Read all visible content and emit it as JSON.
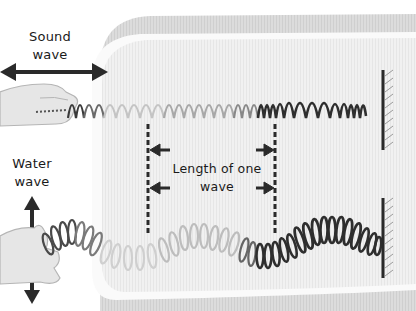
{
  "diagram": {
    "labels": {
      "sound_line1": "Sound",
      "sound_line2": "wave",
      "water_line1": "Water",
      "water_line2": "wave",
      "wavelength": "Length of one wave"
    },
    "nodes": [
      {
        "id": "hand-top",
        "label": "Hand pushing spring (sound wave)"
      },
      {
        "id": "spring-top",
        "label": "Compression spring (longitudinal)"
      },
      {
        "id": "wall-top",
        "label": "Fixed wall"
      },
      {
        "id": "hand-bottom",
        "label": "Hand shaking spring (water wave)"
      },
      {
        "id": "spring-bottom",
        "label": "Spring wave (transverse)"
      },
      {
        "id": "wall-bottom",
        "label": "Fixed wall"
      }
    ],
    "arrows": [
      {
        "id": "sound-motion",
        "direction": "left-right"
      },
      {
        "id": "water-motion",
        "direction": "up-down"
      },
      {
        "id": "wavelength-markers",
        "direction": "inward-pairs"
      }
    ],
    "colors": {
      "frame": "#d6d6d6",
      "frame_inner": "#ececec",
      "ink": "#2a2a2a",
      "faded": "#9a9a9a",
      "hand": "#e4e4e4"
    }
  }
}
